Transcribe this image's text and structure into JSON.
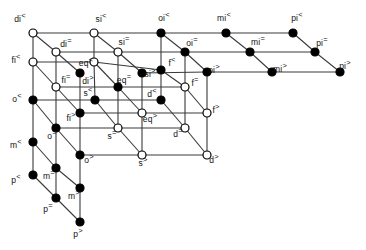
{
  "figure": {
    "type": "lattice-diagram",
    "title": "",
    "background": "#ffffff",
    "edge_color": "#3a3a3a",
    "node_fill_filled": "#000000",
    "node_fill_open": "#ffffff",
    "node_stroke": "#000000",
    "width": 366,
    "height": 250
  },
  "nodes": [
    {
      "id": "di<",
      "label": "di",
      "sup": "<",
      "x": 33,
      "y": 33,
      "filled": false,
      "lx": 20,
      "ly": 19
    },
    {
      "id": "si<",
      "label": "si",
      "sup": "<",
      "x": 94,
      "y": 33,
      "filled": false,
      "lx": 101,
      "ly": 19
    },
    {
      "id": "oi<",
      "label": "oi",
      "sup": "<",
      "x": 161,
      "y": 33,
      "filled": true,
      "lx": 164,
      "ly": 18
    },
    {
      "id": "mi<",
      "label": "mi",
      "sup": "<",
      "x": 226,
      "y": 33,
      "filled": true,
      "lx": 224,
      "ly": 18
    },
    {
      "id": "pi<",
      "label": "pi",
      "sup": "<",
      "x": 293,
      "y": 33,
      "filled": true,
      "lx": 297,
      "ly": 18
    },
    {
      "id": "di=",
      "label": "di",
      "sup": "=",
      "x": 56,
      "y": 52,
      "filled": false,
      "lx": 66,
      "ly": 44
    },
    {
      "id": "si=",
      "label": "si",
      "sup": "=",
      "x": 118,
      "y": 52,
      "filled": false,
      "lx": 124,
      "ly": 42
    },
    {
      "id": "oi=",
      "label": "oi",
      "sup": "=",
      "x": 185,
      "y": 52,
      "filled": true,
      "lx": 192,
      "ly": 43
    },
    {
      "id": "mi=",
      "label": "mi",
      "sup": "=",
      "x": 250,
      "y": 52,
      "filled": true,
      "lx": 258,
      "ly": 42
    },
    {
      "id": "pi=",
      "label": "pi",
      "sup": "=",
      "x": 315,
      "y": 52,
      "filled": true,
      "lx": 322,
      "ly": 43
    },
    {
      "id": "fi<",
      "label": "fi",
      "sup": "<",
      "x": 33,
      "y": 62,
      "filled": false,
      "lx": 16,
      "ly": 60
    },
    {
      "id": "eq<",
      "label": "eq",
      "sup": "<",
      "x": 94,
      "y": 62,
      "filled": false,
      "lx": 86,
      "ly": 63
    },
    {
      "id": "f<",
      "label": "f",
      "sup": "<",
      "x": 161,
      "y": 70,
      "filled": true,
      "lx": 172,
      "ly": 63
    },
    {
      "id": "si>",
      "label": "si",
      "sup": ">",
      "x": 142,
      "y": 73,
      "filled": true,
      "lx": 150,
      "ly": 74
    },
    {
      "id": "oi>",
      "label": "oi",
      "sup": ">",
      "x": 207,
      "y": 72,
      "filled": true,
      "lx": 214,
      "ly": 70
    },
    {
      "id": "mi>",
      "label": "mi",
      "sup": ">",
      "x": 272,
      "y": 72,
      "filled": true,
      "lx": 280,
      "ly": 69
    },
    {
      "id": "pi>",
      "label": "pi",
      "sup": ">",
      "x": 340,
      "y": 72,
      "filled": true,
      "lx": 345,
      "ly": 66
    },
    {
      "id": "fi=",
      "label": "fi",
      "sup": "=",
      "x": 56,
      "y": 87,
      "filled": false,
      "lx": 66,
      "ly": 80
    },
    {
      "id": "di>",
      "label": "di",
      "sup": ">",
      "x": 80,
      "y": 73,
      "filled": true,
      "lx": 88,
      "ly": 81
    },
    {
      "id": "eq=",
      "label": "eq",
      "sup": "=",
      "x": 118,
      "y": 87,
      "filled": true,
      "lx": 124,
      "ly": 80
    },
    {
      "id": "f=",
      "label": "f",
      "sup": "=",
      "x": 185,
      "y": 87,
      "filled": false,
      "lx": 195,
      "ly": 83
    },
    {
      "id": "o<",
      "label": "o",
      "sup": "<",
      "x": 33,
      "y": 100,
      "filled": true,
      "lx": 17,
      "ly": 99
    },
    {
      "id": "s<",
      "label": "s",
      "sup": "<",
      "x": 95,
      "y": 100,
      "filled": true,
      "lx": 88,
      "ly": 93
    },
    {
      "id": "d<",
      "label": "d",
      "sup": "<",
      "x": 161,
      "y": 100,
      "filled": true,
      "lx": 152,
      "ly": 94
    },
    {
      "id": "fi>",
      "label": "fi",
      "sup": ">",
      "x": 80,
      "y": 113,
      "filled": true,
      "lx": 71,
      "ly": 118
    },
    {
      "id": "eq>",
      "label": "eq",
      "sup": ">",
      "x": 142,
      "y": 113,
      "filled": false,
      "lx": 150,
      "ly": 119
    },
    {
      "id": "f>",
      "label": "f",
      "sup": ">",
      "x": 207,
      "y": 113,
      "filled": false,
      "lx": 216,
      "ly": 110
    },
    {
      "id": "o=",
      "label": "o",
      "sup": "=",
      "x": 56,
      "y": 128,
      "filled": true,
      "lx": 52,
      "ly": 136
    },
    {
      "id": "s=",
      "label": "s",
      "sup": "=",
      "x": 118,
      "y": 128,
      "filled": false,
      "lx": 112,
      "ly": 136
    },
    {
      "id": "d=",
      "label": "d",
      "sup": "=",
      "x": 185,
      "y": 128,
      "filled": false,
      "lx": 178,
      "ly": 134
    },
    {
      "id": "o>",
      "label": "o",
      "sup": ">",
      "x": 80,
      "y": 155,
      "filled": true,
      "lx": 89,
      "ly": 160
    },
    {
      "id": "s>",
      "label": "s",
      "sup": ">",
      "x": 142,
      "y": 155,
      "filled": false,
      "lx": 143,
      "ly": 163
    },
    {
      "id": "d>",
      "label": "d",
      "sup": ">",
      "x": 207,
      "y": 155,
      "filled": false,
      "lx": 214,
      "ly": 160
    },
    {
      "id": "m<",
      "label": "m",
      "sup": "<",
      "x": 33,
      "y": 142,
      "filled": true,
      "lx": 16,
      "ly": 145
    },
    {
      "id": "m=",
      "label": "m",
      "sup": "=",
      "x": 56,
      "y": 168,
      "filled": true,
      "lx": 49,
      "ly": 176
    },
    {
      "id": "m>",
      "label": "m",
      "sup": ">",
      "x": 80,
      "y": 188,
      "filled": true,
      "lx": 74,
      "ly": 196
    },
    {
      "id": "p<",
      "label": "p",
      "sup": "<",
      "x": 33,
      "y": 175,
      "filled": true,
      "lx": 16,
      "ly": 180
    },
    {
      "id": "p=",
      "label": "p",
      "sup": "=",
      "x": 56,
      "y": 198,
      "filled": true,
      "lx": 48,
      "ly": 209
    },
    {
      "id": "p>",
      "label": "p",
      "sup": ">",
      "x": 80,
      "y": 222,
      "filled": true,
      "lx": 78,
      "ly": 234
    }
  ],
  "edges": [
    [
      "di<",
      "si<"
    ],
    [
      "si<",
      "oi<"
    ],
    [
      "oi<",
      "mi<"
    ],
    [
      "mi<",
      "pi<"
    ],
    [
      "di=",
      "si="
    ],
    [
      "si=",
      "oi="
    ],
    [
      "oi=",
      "mi="
    ],
    [
      "mi=",
      "pi="
    ],
    [
      "si>",
      "oi>"
    ],
    [
      "oi>",
      "mi>"
    ],
    [
      "mi>",
      "pi>"
    ],
    [
      "fi<",
      "eq<"
    ],
    [
      "eq<",
      "f<"
    ],
    [
      "fi=",
      "eq="
    ],
    [
      "eq=",
      "f="
    ],
    [
      "fi>",
      "eq>"
    ],
    [
      "eq>",
      "f>"
    ],
    [
      "o<",
      "s<"
    ],
    [
      "s<",
      "d<"
    ],
    [
      "o=",
      "s="
    ],
    [
      "s=",
      "d="
    ],
    [
      "o>",
      "s>"
    ],
    [
      "s>",
      "d>"
    ],
    [
      "di<",
      "di="
    ],
    [
      "si<",
      "si="
    ],
    [
      "oi<",
      "oi="
    ],
    [
      "mi<",
      "mi="
    ],
    [
      "pi<",
      "pi="
    ],
    [
      "di=",
      "di>"
    ],
    [
      "si=",
      "si>"
    ],
    [
      "oi=",
      "oi>"
    ],
    [
      "mi=",
      "mi>"
    ],
    [
      "pi=",
      "pi>"
    ],
    [
      "fi<",
      "fi="
    ],
    [
      "eq<",
      "eq="
    ],
    [
      "f<",
      "f="
    ],
    [
      "fi=",
      "fi>"
    ],
    [
      "eq=",
      "eq>"
    ],
    [
      "f=",
      "f>"
    ],
    [
      "o<",
      "o="
    ],
    [
      "s<",
      "s="
    ],
    [
      "d<",
      "d="
    ],
    [
      "o=",
      "o>"
    ],
    [
      "s=",
      "s>"
    ],
    [
      "d=",
      "d>"
    ],
    [
      "m<",
      "m="
    ],
    [
      "m=",
      "m>"
    ],
    [
      "p<",
      "p="
    ],
    [
      "p=",
      "p>"
    ],
    [
      "di<",
      "fi<"
    ],
    [
      "si<",
      "eq<"
    ],
    [
      "oi<",
      "f<"
    ],
    [
      "di=",
      "fi="
    ],
    [
      "si=",
      "eq="
    ],
    [
      "oi=",
      "f="
    ],
    [
      "di>",
      "fi>"
    ],
    [
      "si>",
      "eq>"
    ],
    [
      "oi>",
      "f>"
    ],
    [
      "fi<",
      "o<"
    ],
    [
      "eq<",
      "s<"
    ],
    [
      "f<",
      "d<"
    ],
    [
      "fi=",
      "o="
    ],
    [
      "eq=",
      "s="
    ],
    [
      "f=",
      "d="
    ],
    [
      "fi>",
      "o>"
    ],
    [
      "eq>",
      "s>"
    ],
    [
      "f>",
      "d>"
    ],
    [
      "o<",
      "m<"
    ],
    [
      "m<",
      "p<"
    ],
    [
      "o=",
      "m="
    ],
    [
      "m=",
      "p="
    ],
    [
      "o>",
      "m>"
    ],
    [
      "m>",
      "p>"
    ],
    [
      "di<",
      "di="
    ],
    [
      "di=",
      "fi="
    ],
    [
      "fi<",
      "fi="
    ],
    [
      "o<",
      "o="
    ],
    [
      "o=",
      "m="
    ],
    [
      "m<",
      "m="
    ],
    [
      "p<",
      "p="
    ]
  ],
  "legend": {
    "filled_meaning": "",
    "open_meaning": ""
  }
}
